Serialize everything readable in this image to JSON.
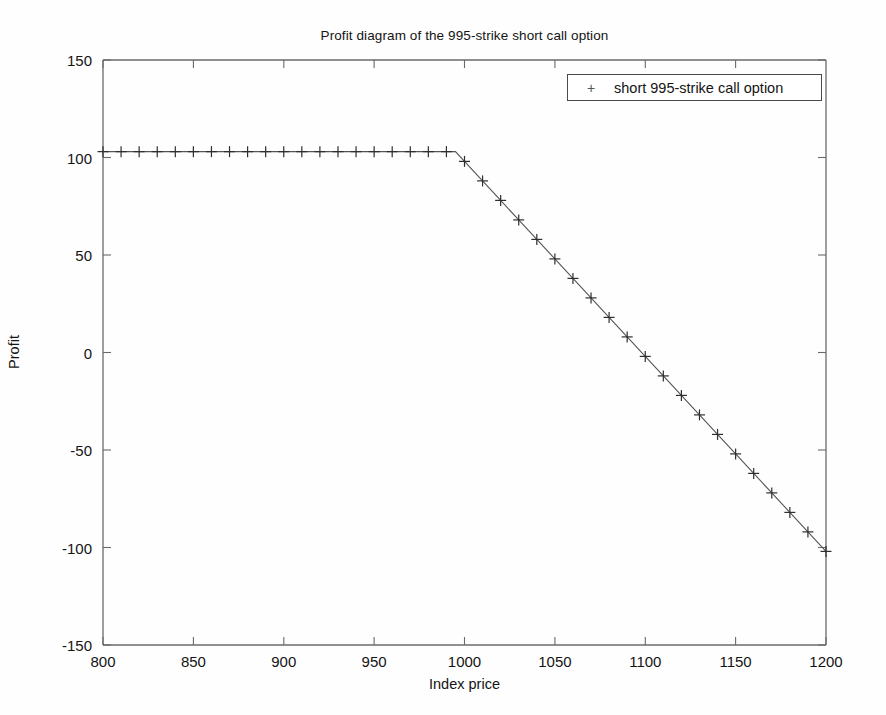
{
  "figure": {
    "background_color": "#fefefe",
    "axes_color": "#555555",
    "series_color": "#3a3a3a"
  },
  "axis": {
    "x_title": "Index price",
    "y_title": "Profit",
    "x_ticks": [
      "800",
      "850",
      "900",
      "950",
      "1000",
      "1050",
      "1100",
      "1150",
      "1200"
    ],
    "y_ticks": [
      "150",
      "100",
      "50",
      "0",
      "-50",
      "-100",
      "-150"
    ]
  },
  "legend": {
    "marker": "+",
    "label": "short 995-strike call option"
  },
  "chart_data": {
    "type": "line",
    "title": "Profit diagram of the 995-strike short call option",
    "xlabel": "Index price",
    "ylabel": "Profit",
    "xlim": [
      800,
      1200
    ],
    "ylim": [
      -150,
      150
    ],
    "xticks": [
      800,
      850,
      900,
      950,
      1000,
      1050,
      1100,
      1150,
      1200
    ],
    "yticks": [
      -150,
      -100,
      -50,
      0,
      50,
      100,
      150
    ],
    "grid": false,
    "legend_position": "upper right",
    "marker": "+",
    "strike": 995,
    "premium": 103,
    "breakeven": 1098,
    "series": [
      {
        "name": "short 995-strike call option",
        "x": [
          800,
          810,
          820,
          830,
          840,
          850,
          860,
          870,
          880,
          890,
          900,
          910,
          920,
          930,
          940,
          950,
          960,
          970,
          980,
          990,
          995,
          1000,
          1010,
          1020,
          1030,
          1040,
          1050,
          1060,
          1070,
          1080,
          1090,
          1100,
          1110,
          1120,
          1130,
          1140,
          1150,
          1160,
          1170,
          1180,
          1190,
          1200
        ],
        "values": [
          103,
          103,
          103,
          103,
          103,
          103,
          103,
          103,
          103,
          103,
          103,
          103,
          103,
          103,
          103,
          103,
          103,
          103,
          103,
          103,
          103,
          98,
          88,
          78,
          68,
          58,
          48,
          38,
          28,
          18,
          8,
          -2,
          -12,
          -22,
          -32,
          -42,
          -52,
          -62,
          -72,
          -82,
          -92,
          -102
        ]
      }
    ]
  }
}
